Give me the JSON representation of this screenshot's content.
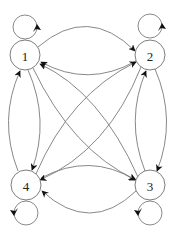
{
  "diagram": {
    "type": "directed-graph",
    "colors": {
      "stroke": "#7a7a7a",
      "arrow": "#111111",
      "node_fill": "#ffffff",
      "label": "#222222"
    },
    "nodes": [
      {
        "id": "1",
        "label": "1",
        "cx": 25,
        "cy": 55,
        "r": 15,
        "loop": {
          "cx": 25,
          "cy": 27,
          "r": 12
        }
      },
      {
        "id": "2",
        "label": "2",
        "cx": 150,
        "cy": 55,
        "r": 15,
        "loop": {
          "cx": 150,
          "cy": 26,
          "r": 12
        }
      },
      {
        "id": "3",
        "label": "3",
        "cx": 150,
        "cy": 185,
        "r": 15,
        "loop": {
          "cx": 150,
          "cy": 213,
          "r": 12
        }
      },
      {
        "id": "4",
        "label": "4",
        "cx": 26,
        "cy": 185,
        "r": 15,
        "loop": {
          "cx": 26,
          "cy": 213,
          "r": 12
        }
      }
    ],
    "edges": [
      {
        "from": "1",
        "to": "1",
        "kind": "self-loop"
      },
      {
        "from": "2",
        "to": "2",
        "kind": "self-loop"
      },
      {
        "from": "3",
        "to": "3",
        "kind": "self-loop"
      },
      {
        "from": "4",
        "to": "4",
        "kind": "self-loop"
      },
      {
        "from": "1",
        "to": "2"
      },
      {
        "from": "2",
        "to": "1"
      },
      {
        "from": "4",
        "to": "3"
      },
      {
        "from": "3",
        "to": "4"
      },
      {
        "from": "1",
        "to": "4"
      },
      {
        "from": "4",
        "to": "1"
      },
      {
        "from": "2",
        "to": "3"
      },
      {
        "from": "3",
        "to": "2"
      },
      {
        "from": "1",
        "to": "3"
      },
      {
        "from": "3",
        "to": "1"
      },
      {
        "from": "2",
        "to": "4"
      },
      {
        "from": "4",
        "to": "2"
      }
    ]
  }
}
